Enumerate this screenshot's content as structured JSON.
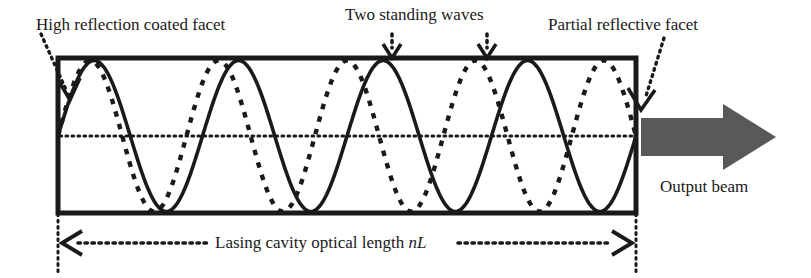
{
  "figure": {
    "title_labels": {
      "high_reflection": "High reflection coated facet",
      "two_standing_waves": "Two standing waves",
      "partial_reflective": "Partial reflective facet",
      "output_beam": "Output beam"
    },
    "dimension_label": {
      "text_main": "Lasing cavity optical length ",
      "text_italic": "nL"
    },
    "colors": {
      "stroke": "#1a1a1a",
      "beam_fill": "#595959",
      "background": "#ffffff"
    }
  },
  "chart_data": {
    "type": "line",
    "xlabel": "Lasing cavity optical length nL",
    "ylabel": "",
    "xlim": [
      0,
      1
    ],
    "ylim": [
      -1,
      1
    ],
    "grid": false,
    "legend": "none",
    "cavity_box": {
      "x0": 58,
      "y0": 58,
      "x1": 636,
      "y1": 213
    },
    "axis_line_y": 136,
    "series": [
      {
        "name": "standing-wave-solid",
        "style": "solid",
        "half_periods": 8,
        "phase_deg": 0,
        "amplitude": 1,
        "node_count": 9,
        "x": [
          0,
          0.0625,
          0.125,
          0.1875,
          0.25,
          0.3125,
          0.375,
          0.4375,
          0.5,
          0.5625,
          0.625,
          0.6875,
          0.75,
          0.8125,
          0.875,
          0.9375,
          1
        ],
        "values": [
          0,
          1,
          0,
          -1,
          0,
          1,
          0,
          -1,
          0,
          1,
          0,
          -1,
          0,
          1,
          0,
          -1,
          0
        ]
      },
      {
        "name": "standing-wave-dashed",
        "style": "dashed",
        "half_periods": 9,
        "phase_deg": 0,
        "amplitude": 1,
        "node_count": 10,
        "x": [
          0,
          0.0556,
          0.1111,
          0.1667,
          0.2222,
          0.2778,
          0.3333,
          0.3889,
          0.4444,
          0.5,
          0.5556,
          0.6111,
          0.6667,
          0.7222,
          0.7778,
          0.8333,
          0.8889,
          0.9444,
          1
        ],
        "values": [
          0,
          1,
          0,
          -1,
          0,
          1,
          0,
          -1,
          0,
          1,
          0,
          -1,
          0,
          1,
          0,
          -1,
          0,
          1,
          0
        ]
      }
    ],
    "annotations": [
      {
        "name": "high-reflection-coated-facet",
        "text": "High reflection coated facet",
        "target_x": 58,
        "target_y": 95
      },
      {
        "name": "two-standing-waves",
        "text": "Two standing waves",
        "target_x": 392,
        "target_y": 58
      },
      {
        "name": "two-standing-waves-2",
        "text": "Two standing waves",
        "target_x": 487,
        "target_y": 58
      },
      {
        "name": "partial-reflective-facet",
        "text": "Partial reflective facet",
        "target_x": 634,
        "target_y": 120
      },
      {
        "name": "output-beam",
        "text": "Output beam",
        "target_x": 710,
        "target_y": 137
      }
    ]
  }
}
